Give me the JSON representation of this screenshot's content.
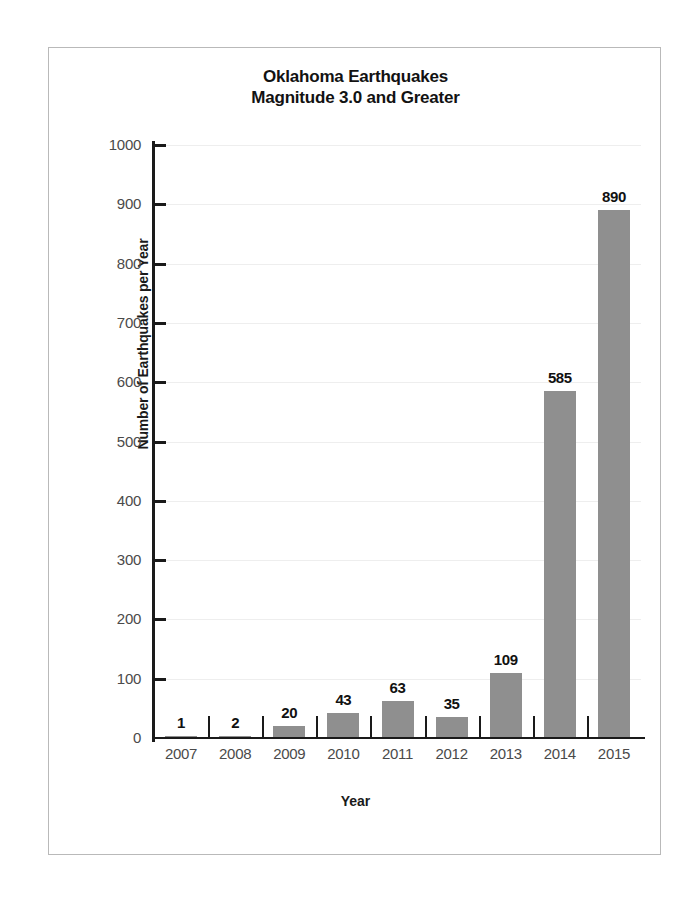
{
  "chart_data": {
    "type": "bar",
    "title": "Oklahoma Earthquakes Magnitude 3.0 and Greater",
    "title_line1": "Oklahoma Earthquakes",
    "title_line2": "Magnitude 3.0 and Greater",
    "xlabel": "Year",
    "ylabel": "Number of Earthquakes per Year",
    "categories": [
      "2007",
      "2008",
      "2009",
      "2010",
      "2011",
      "2012",
      "2013",
      "2014",
      "2015"
    ],
    "values": [
      1,
      2,
      20,
      43,
      63,
      35,
      109,
      585,
      890
    ],
    "value_labels": [
      "1",
      "2",
      "20",
      "43",
      "63",
      "35",
      "109",
      "585",
      "890"
    ],
    "ylim": [
      0,
      1000
    ],
    "ytick_labels": [
      "0",
      "100",
      "200",
      "300",
      "400",
      "500",
      "600",
      "700",
      "800",
      "900",
      "1000"
    ],
    "ytick_values": [
      0,
      100,
      200,
      300,
      400,
      500,
      600,
      700,
      800,
      900,
      1000
    ],
    "grid": true,
    "legend": false,
    "bar_color": "#8f8f8f",
    "axis_color": "#1a1a1a",
    "gridline_color": "#eeeeee",
    "frame_color": "#b9b9b9",
    "background_color": "#ffffff"
  }
}
